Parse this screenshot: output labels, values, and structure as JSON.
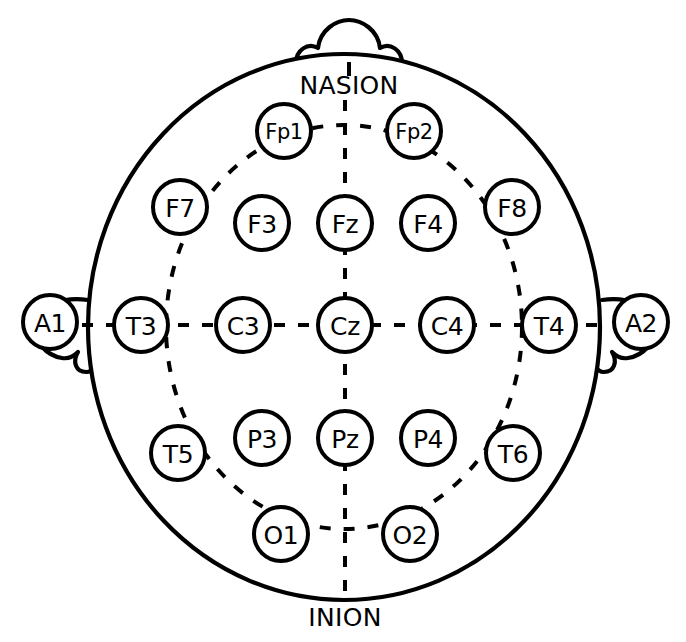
{
  "diagram": {
    "name": "eeg-10-20-electrode-placement",
    "background_color": "#ffffff",
    "stroke_color": "#000000",
    "head": {
      "center_x": 344,
      "center_y": 327,
      "radius_x": 256,
      "radius_y": 273
    },
    "guide_circle": {
      "center_x": 344,
      "center_y": 327,
      "radius_x": 178,
      "radius_y": 202
    },
    "landmarks": [
      {
        "id": "nasion",
        "label": "NASION",
        "x": 349,
        "y": 85
      },
      {
        "id": "inion",
        "label": "INION",
        "x": 345,
        "y": 617
      }
    ],
    "nose": {
      "id": "nose",
      "label": "nose-bump"
    },
    "ears": [
      {
        "id": "left-ear",
        "side": "left"
      },
      {
        "id": "right-ear",
        "side": "right"
      }
    ],
    "electrodes": [
      {
        "id": "Fp1",
        "label": "Fp1",
        "x": 284,
        "y": 131,
        "r": 27,
        "group": "prefrontal",
        "hemisphere": "left"
      },
      {
        "id": "Fp2",
        "label": "Fp2",
        "x": 414,
        "y": 131,
        "r": 27,
        "group": "prefrontal",
        "hemisphere": "right"
      },
      {
        "id": "F7",
        "label": "F7",
        "x": 180,
        "y": 207,
        "r": 27,
        "group": "frontal",
        "hemisphere": "left"
      },
      {
        "id": "F3",
        "label": "F3",
        "x": 262,
        "y": 223,
        "r": 27,
        "group": "frontal",
        "hemisphere": "left"
      },
      {
        "id": "Fz",
        "label": "Fz",
        "x": 345,
        "y": 223,
        "r": 27,
        "group": "frontal",
        "hemisphere": "midline"
      },
      {
        "id": "F4",
        "label": "F4",
        "x": 428,
        "y": 223,
        "r": 27,
        "group": "frontal",
        "hemisphere": "right"
      },
      {
        "id": "F8",
        "label": "F8",
        "x": 512,
        "y": 207,
        "r": 27,
        "group": "frontal",
        "hemisphere": "right"
      },
      {
        "id": "A1",
        "label": "A1",
        "x": 50,
        "y": 322,
        "r": 27,
        "group": "reference",
        "hemisphere": "left"
      },
      {
        "id": "T3",
        "label": "T3",
        "x": 141,
        "y": 325,
        "r": 27,
        "group": "temporal",
        "hemisphere": "left"
      },
      {
        "id": "C3",
        "label": "C3",
        "x": 243,
        "y": 325,
        "r": 27,
        "group": "central",
        "hemisphere": "left"
      },
      {
        "id": "Cz",
        "label": "Cz",
        "x": 345,
        "y": 325,
        "r": 27,
        "group": "central",
        "hemisphere": "midline"
      },
      {
        "id": "C4",
        "label": "C4",
        "x": 447,
        "y": 325,
        "r": 27,
        "group": "central",
        "hemisphere": "right"
      },
      {
        "id": "T4",
        "label": "T4",
        "x": 549,
        "y": 325,
        "r": 27,
        "group": "temporal",
        "hemisphere": "right"
      },
      {
        "id": "A2",
        "label": "A2",
        "x": 641,
        "y": 322,
        "r": 27,
        "group": "reference",
        "hemisphere": "right"
      },
      {
        "id": "T5",
        "label": "T5",
        "x": 178,
        "y": 453,
        "r": 27,
        "group": "temporal",
        "hemisphere": "left"
      },
      {
        "id": "P3",
        "label": "P3",
        "x": 262,
        "y": 438,
        "r": 27,
        "group": "parietal",
        "hemisphere": "left"
      },
      {
        "id": "Pz",
        "label": "Pz",
        "x": 345,
        "y": 438,
        "r": 27,
        "group": "parietal",
        "hemisphere": "midline"
      },
      {
        "id": "P4",
        "label": "P4",
        "x": 428,
        "y": 438,
        "r": 27,
        "group": "parietal",
        "hemisphere": "right"
      },
      {
        "id": "T6",
        "label": "T6",
        "x": 513,
        "y": 453,
        "r": 27,
        "group": "temporal",
        "hemisphere": "right"
      },
      {
        "id": "O1",
        "label": "O1",
        "x": 281,
        "y": 534,
        "r": 27,
        "group": "occipital",
        "hemisphere": "left"
      },
      {
        "id": "O2",
        "label": "O2",
        "x": 410,
        "y": 534,
        "r": 27,
        "group": "occipital",
        "hemisphere": "right"
      }
    ],
    "connector_lines": [
      {
        "id": "horizontal-midline",
        "from": "A1",
        "to": "A2",
        "orientation": "horizontal"
      },
      {
        "id": "vertical-midline",
        "from": "NASION",
        "to": "INION",
        "orientation": "vertical"
      }
    ]
  }
}
